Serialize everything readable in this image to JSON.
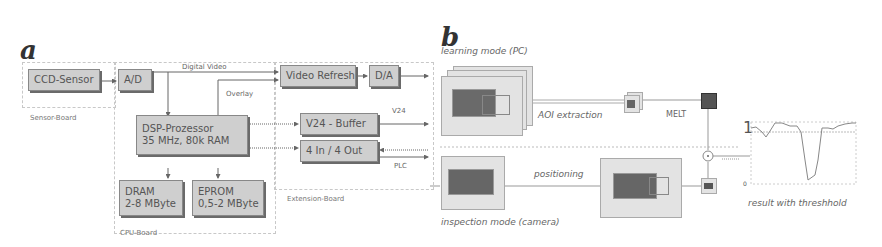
{
  "panel_a": {
    "letter": "a",
    "boards": {
      "sensor": "Sensor-Board",
      "cpu": "CPU-Board",
      "extension": "Extension-Board"
    },
    "blocks": {
      "ccd_sensor": "CCD-Sensor",
      "ad": "A/D",
      "video_refresh": "Video Refresh",
      "da": "D/A",
      "dsp_line1": "DSP-Prozessor",
      "dsp_line2": "35 MHz, 80k RAM",
      "v24_buffer": "V24 - Buffer",
      "io": "4 In / 4 Out",
      "dram_line1": "DRAM",
      "dram_line2": "2-8 MByte",
      "eprom_line1": "EPROM",
      "eprom_line2": "0,5-2 MByte"
    },
    "signals": {
      "digital_video": "Digital Video",
      "overlay": "Overlay",
      "v24": "V24",
      "plc": "PLC"
    }
  },
  "panel_b": {
    "letter": "b",
    "learning_mode": "learning mode (PC)",
    "aoi_extraction": "AOI extraction",
    "melt": "MELT",
    "positioning": "positioning",
    "inspection_mode": "inspection mode (camera)",
    "result_caption": "result with threshhold",
    "plot_axis": {
      "top": "1",
      "bottom": "0"
    }
  },
  "colors": {
    "block_fill": "#cfcfcf",
    "block_shadow": "#6a6a6a",
    "line": "#666666",
    "board_border": "#c8c8c8"
  }
}
